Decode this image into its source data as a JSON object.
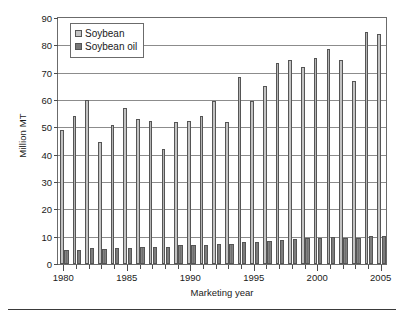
{
  "chart_data": {
    "type": "bar",
    "title": "",
    "xlabel": "Marketing year",
    "ylabel": "Million MT",
    "ylim": [
      0,
      90
    ],
    "ytick_step": 10,
    "yticks": [
      0,
      10,
      20,
      30,
      40,
      50,
      60,
      70,
      80,
      90
    ],
    "grid": true,
    "legend_position": "top-left",
    "categories": [
      "1980",
      "1981",
      "1982",
      "1983",
      "1984",
      "1985",
      "1986",
      "1987",
      "1988",
      "1989",
      "1990",
      "1991",
      "1992",
      "1993",
      "1994",
      "1995",
      "1996",
      "1997",
      "1998",
      "1999",
      "2000",
      "2001",
      "2002",
      "2003",
      "2004",
      "2005"
    ],
    "xtick_labels": [
      "1980",
      "1985",
      "1990",
      "1995",
      "2000",
      "2005"
    ],
    "series": [
      {
        "name": "Soybean",
        "color": "#c4c4c4",
        "values": [
          49,
          54,
          60,
          44.5,
          51,
          57,
          53,
          52.5,
          42,
          52,
          52.5,
          54,
          59.5,
          52,
          68.5,
          59.5,
          65,
          73.5,
          74.5,
          72,
          75.5,
          78.5,
          74.5,
          67,
          85,
          84
        ]
      },
      {
        "name": "Soybean oil",
        "color": "#787878",
        "values": [
          5.2,
          5.3,
          5.8,
          5.4,
          5.7,
          6.0,
          6.3,
          6.2,
          6.4,
          6.8,
          6.9,
          7.1,
          7.4,
          7.5,
          8.0,
          8.2,
          8.6,
          8.8,
          9.3,
          9.5,
          9.6,
          9.8,
          9.7,
          9.6,
          10.1,
          10.3
        ]
      }
    ]
  },
  "legend": {
    "items": [
      {
        "label": "Soybean"
      },
      {
        "label": "Soybean oil"
      }
    ]
  },
  "axes": {
    "x_title": "Marketing year",
    "y_title": "Million MT"
  }
}
